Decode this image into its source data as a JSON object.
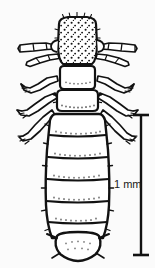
{
  "figure": {
    "kind": "scientific-line-drawing",
    "background_color": "#fbfbfb",
    "ink_color": "#121212",
    "width_px": 155,
    "height_px": 268
  },
  "scale": {
    "label": "1 mm",
    "orientation": "vertical",
    "cap_style": "serif-bar",
    "color": "#121212",
    "bar_x_px": 141,
    "bar_top_px": 114,
    "bar_bottom_px": 256,
    "label_x_px": 114,
    "label_y_px": 178
  },
  "anatomy": {
    "head": {
      "label": "head",
      "texture": "stippled-setae",
      "top_px": 18,
      "bottom_px": 68
    },
    "antennae": {
      "label": "antennae",
      "count": 2,
      "segments_each": 4,
      "direction": "lateral"
    },
    "thorax": {
      "label": "thorax",
      "segments": 2,
      "top_px": 68,
      "bottom_px": 110
    },
    "legs": {
      "label": "legs",
      "count": 6,
      "termination": "claw"
    },
    "abdomen": {
      "label": "abdomen",
      "segments": 6,
      "top_px": 110,
      "bottom_px": 246,
      "texture": "banded-stippled"
    },
    "terminal_segment": {
      "label": "terminal-abdominal-segment",
      "shape": "rounded"
    }
  }
}
